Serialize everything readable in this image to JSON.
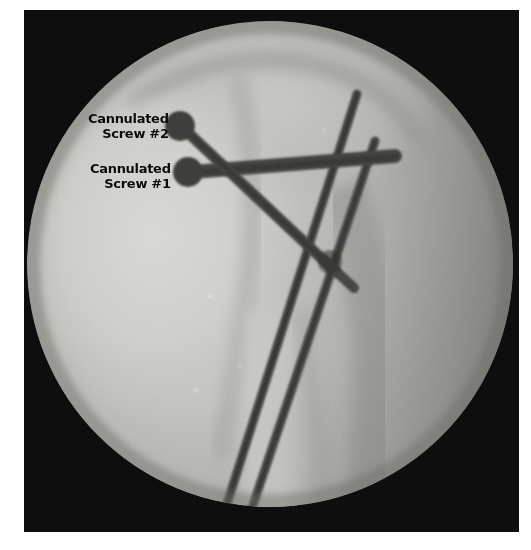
{
  "image": {
    "kind": "intraoperative-fluoroscopic-radiograph",
    "view": "lateral hip / proximal femur",
    "frame": {
      "background_color": "#0d0d0d",
      "page_background_color": "#ffffff",
      "left": 24,
      "top": 10,
      "width": 495,
      "height": 522
    },
    "field_of_view": {
      "shape": "circle",
      "center_x": 246,
      "center_y": 254,
      "radius": 243,
      "bright_tone": "#c9c9c5",
      "mid_tone": "#a8a8a4",
      "dark_tone": "#7d7d79"
    }
  },
  "annotations": [
    {
      "id": "screw-2",
      "line1": "Cannulated",
      "line2": "Screw #2",
      "text_color": "#0a0a0a",
      "points_to": "upper cannulated screw head"
    },
    {
      "id": "screw-1",
      "line1": "Cannulated",
      "line2": "Screw #1",
      "text_color": "#0a0a0a",
      "points_to": "lower cannulated screw head"
    }
  ],
  "hardware": [
    {
      "name": "cannulated-screw-2",
      "type": "cannulated screw",
      "head_x": 157,
      "head_y": 115,
      "head_r": 15,
      "tip_x": 305,
      "tip_y": 258,
      "shaft_width": 11,
      "color": "#4a4a48"
    },
    {
      "name": "cannulated-screw-1",
      "type": "cannulated screw",
      "head_x": 166,
      "head_y": 161,
      "head_r": 15,
      "tip_x": 371,
      "tip_y": 146,
      "shaft_width": 13,
      "color": "#4a4a48"
    },
    {
      "name": "guide-wire-lateral",
      "type": "guide wire / k-wire",
      "top_x": 333,
      "top_y": 84,
      "bottom_x": 196,
      "bottom_y": 512,
      "width": 9,
      "color": "#474745"
    },
    {
      "name": "guide-wire-medial",
      "type": "guide wire / k-wire",
      "top_x": 351,
      "top_y": 131,
      "bottom_x": 222,
      "bottom_y": 512,
      "width": 9,
      "color": "#474745"
    }
  ],
  "anatomy": [
    {
      "name": "femoral-head",
      "description": "rounded bright femoral head, superior"
    },
    {
      "name": "greater-trochanter",
      "description": "bright bone mass, left of center"
    },
    {
      "name": "femoral-shaft",
      "description": "vertical bone column, inferior"
    },
    {
      "name": "soft-tissue-shadow",
      "description": "darker gradient, right field"
    }
  ]
}
